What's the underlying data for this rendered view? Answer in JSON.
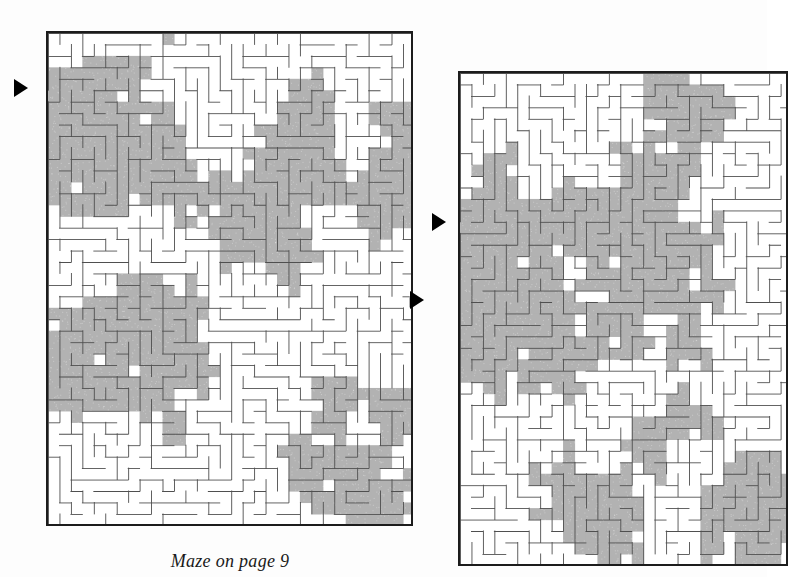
{
  "page": {
    "width": 767,
    "height": 577,
    "background_color": "#fdfdfd",
    "document_type": "maze-puzzle-solution-figure"
  },
  "palette": {
    "wall_color": "#4f4f4f",
    "border_color": "#1c1c1c",
    "solution_fill": "#b2b2b2",
    "open_fill": "#ffffff",
    "marker_color": "#000000",
    "caption_color": "#1a1a1a"
  },
  "caption": {
    "text": "Maze on page 9",
    "x": 230,
    "y": 551,
    "font_size": 18,
    "italic": true
  },
  "mazes": [
    {
      "id": "maze-left",
      "label": "Maze on page 9 solution (left)",
      "x": 46,
      "y": 31,
      "width": 367,
      "height": 495,
      "cols": 32,
      "rows": 43,
      "cell": 11.45,
      "seed": 20481,
      "clipped": false,
      "entry": {
        "side": "left",
        "row": 5,
        "marker_x": 14,
        "marker_y": 79
      },
      "exit": {
        "side": "right",
        "row": 23,
        "marker_x": 410,
        "marker_y": 291
      },
      "solution_density": 0.42
    },
    {
      "id": "maze-right",
      "label": "Maze on page 9 solution (right, cropped)",
      "x": 458,
      "y": 71,
      "width": 330,
      "height": 495,
      "cols": 29,
      "rows": 43,
      "cell": 11.45,
      "seed": 77315,
      "clipped": true,
      "entry": {
        "side": "left",
        "row": 13,
        "marker_x": 432,
        "marker_y": 213
      },
      "exit": null,
      "solution_density": 0.45
    }
  ],
  "markers": [
    {
      "name": "entry-arrow-left-maze",
      "shape": "right-triangle",
      "x": 14,
      "y": 79
    },
    {
      "name": "exit-arrow-left-maze",
      "shape": "right-triangle",
      "x": 410,
      "y": 291
    },
    {
      "name": "entry-arrow-right-maze",
      "shape": "right-triangle",
      "x": 432,
      "y": 213
    }
  ]
}
